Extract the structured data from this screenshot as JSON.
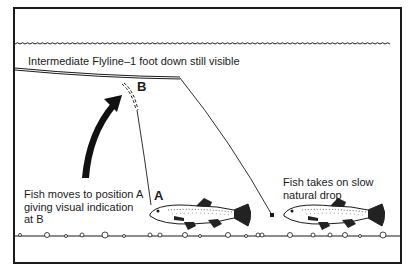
{
  "diagram": {
    "title_label": "Intermediate Flyline–1 foot down still visible",
    "position_b_label": "B",
    "position_a_label": "A",
    "left_caption_lines": [
      "Fish moves to position A",
      "giving visual indication",
      "at B"
    ],
    "right_caption_lines": [
      "Fish takes on slow",
      "natural drop"
    ],
    "colors": {
      "ink": "#1a1a1a",
      "background": "#ffffff"
    },
    "elements": [
      "water-surface",
      "intermediate-flyline",
      "leader-to-fish-a",
      "leader-to-fly",
      "movement-arrow",
      "fish-a",
      "fish-b",
      "fly",
      "lake-bed"
    ]
  }
}
